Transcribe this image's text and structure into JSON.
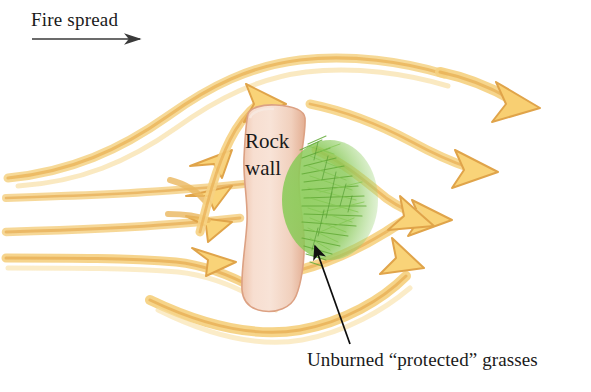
{
  "figure": {
    "title_label": "Fire spread",
    "caption": "Unburned “protected” grasses",
    "subject_label_line1": "Rock",
    "subject_label_line2": "wall",
    "background_color": "#ffffff"
  },
  "colors": {
    "flow_band_fill": "#f7cf72",
    "flow_band_edge": "#e0a94e",
    "flow_band_light": "#fbe6b0",
    "rock_fill_light": "#f7e0d2",
    "rock_fill_mid": "#f0cbb6",
    "rock_edge": "#d99a79",
    "grass_green": "#7cc24a",
    "grass_green_dark": "#4f9a2f",
    "leader_line": "#000000",
    "text_color": "#1a1a1a"
  },
  "elements": {
    "fire_spread_arrow": "arrow-right-icon",
    "leader_arrow": "leader-arrow-icon",
    "rock_wall": "rock-wall-shape",
    "grass_patch": "grass-patch-shape",
    "flow_arrows": "airflow-arrows"
  }
}
